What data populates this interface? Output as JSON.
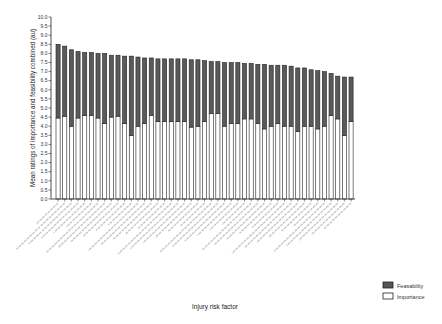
{
  "chart_data": {
    "type": "bar",
    "stacked": true,
    "title": "",
    "xlabel": "Injury risk factor",
    "ylabel": "Mean ratings of importance and feasibility combined (au)",
    "ylim": [
      0,
      10
    ],
    "yticks": [
      "0.0",
      "0.5",
      "1.0",
      "1.5",
      "2.0",
      "2.5",
      "3.0",
      "3.5",
      "4.0",
      "4.5",
      "5.0",
      "5.5",
      "6.0",
      "6.5",
      "7.0",
      "7.5",
      "8.0",
      "8.5",
      "9.0",
      "9.5",
      "10.0"
    ],
    "grid": false,
    "legend_position": "bottom-right",
    "categories": [
      "1",
      "2",
      "3",
      "4",
      "5",
      "6",
      "7",
      "8",
      "9",
      "10",
      "11",
      "12",
      "13",
      "14",
      "15",
      "16",
      "17",
      "18",
      "19",
      "20",
      "21",
      "22",
      "23",
      "24",
      "25",
      "26",
      "27",
      "28",
      "29",
      "30",
      "31",
      "32",
      "33",
      "34",
      "35",
      "36",
      "37",
      "38",
      "39",
      "40",
      "41",
      "42",
      "43",
      "44",
      "45"
    ],
    "totals": [
      8.5,
      8.4,
      8.2,
      8.1,
      8.05,
      8.05,
      8.0,
      8.0,
      7.9,
      7.9,
      7.85,
      7.85,
      7.8,
      7.75,
      7.75,
      7.7,
      7.7,
      7.7,
      7.7,
      7.7,
      7.65,
      7.65,
      7.6,
      7.55,
      7.55,
      7.5,
      7.5,
      7.5,
      7.45,
      7.45,
      7.4,
      7.4,
      7.35,
      7.35,
      7.35,
      7.3,
      7.2,
      7.2,
      7.1,
      7.05,
      7.0,
      6.9,
      6.75,
      6.7,
      6.7
    ],
    "series": [
      {
        "name": "Importance",
        "color": "#ffffff",
        "values": [
          4.45,
          4.55,
          4.0,
          4.45,
          4.6,
          4.6,
          4.45,
          4.15,
          4.5,
          4.55,
          4.15,
          3.5,
          4.0,
          4.15,
          4.6,
          4.25,
          4.25,
          4.25,
          4.25,
          4.25,
          3.95,
          4.0,
          4.25,
          4.7,
          4.7,
          4.0,
          4.15,
          4.15,
          4.4,
          4.4,
          4.15,
          3.85,
          4.0,
          4.15,
          4.0,
          4.0,
          3.7,
          4.0,
          4.0,
          3.85,
          4.0,
          4.6,
          4.4,
          3.5,
          4.25
        ]
      },
      {
        "name": "Feasability",
        "color": "#555555",
        "values": [
          4.05,
          3.85,
          4.2,
          3.65,
          3.45,
          3.45,
          3.55,
          3.85,
          3.4,
          3.35,
          3.7,
          4.35,
          3.8,
          3.6,
          3.15,
          3.45,
          3.45,
          3.45,
          3.45,
          3.45,
          3.7,
          3.65,
          3.35,
          2.85,
          2.85,
          3.5,
          3.35,
          3.35,
          3.05,
          3.05,
          3.25,
          3.55,
          3.35,
          3.2,
          3.35,
          3.3,
          3.5,
          3.2,
          3.1,
          3.2,
          3.0,
          2.3,
          2.35,
          3.2,
          2.45
        ]
      }
    ]
  },
  "legend": [
    {
      "label": "Feasability",
      "swatch": "dark"
    },
    {
      "label": "Importance",
      "swatch": "light"
    }
  ]
}
